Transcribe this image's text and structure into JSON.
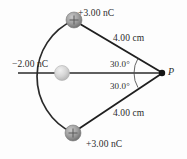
{
  "figure": {
    "background_color": "#fdfdfd",
    "line_color": "#1f1f1f",
    "labels": {
      "charge_top": "+3.00 nC",
      "charge_left": "−2.00 nC",
      "charge_bottom": "+3.00 nC",
      "distance_top": "4.00 cm",
      "distance_bottom": "4.00 cm",
      "angle_top": "30.0°",
      "angle_bottom": "30.0°",
      "point_label": "P"
    },
    "charges": [
      {
        "name": "top-charge",
        "value": "+3.00 nC",
        "sign": "+",
        "x": 74,
        "y": 20,
        "r": 8,
        "fill": "#9a9a9a"
      },
      {
        "name": "left-charge",
        "value": "−2.00 nC",
        "sign": "",
        "x": 62,
        "y": 73,
        "r": 7.5,
        "fill": "#d2d2d2"
      },
      {
        "name": "bottom-charge",
        "value": "+3.00 nC",
        "sign": "+",
        "x": 73,
        "y": 133,
        "r": 8,
        "fill": "#9a9a9a"
      }
    ],
    "field_point": {
      "name": "point-P",
      "x": 162,
      "y": 73,
      "r": 3.2,
      "fill": "#141414"
    },
    "axis_line": {
      "x1": 18,
      "y1": 73,
      "x2": 162,
      "y2": 73
    },
    "rays": [
      {
        "name": "ray-top-charge-to-P",
        "x1": 74,
        "y1": 20,
        "x2": 162,
        "y2": 73
      },
      {
        "name": "ray-bottom-charge-to-P",
        "x1": 73,
        "y1": 133,
        "x2": 162,
        "y2": 73
      }
    ],
    "arc": {
      "name": "charge-arc",
      "x1": 74,
      "y1": 20,
      "x2": 73,
      "y2": 133,
      "rx": 60,
      "ry": 60
    },
    "angle_arcs": [
      {
        "name": "angle-arc-top",
        "cx": 162,
        "cy": 73,
        "r": 28,
        "from_deg": 180,
        "to_deg": 211
      },
      {
        "name": "angle-arc-bottom",
        "cx": 162,
        "cy": 73,
        "r": 28,
        "from_deg": 149,
        "to_deg": 180
      }
    ]
  }
}
